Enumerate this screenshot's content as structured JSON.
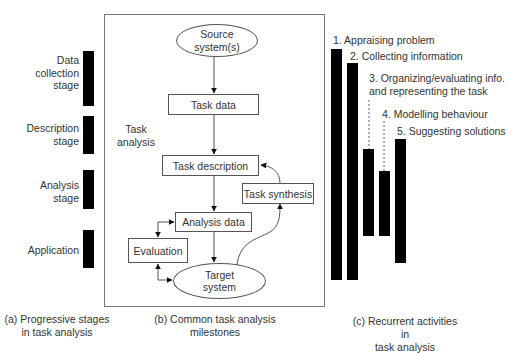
{
  "panel_a": {
    "stages": [
      {
        "label": "Data\ncollection\nstage",
        "bar": {
          "x": 83,
          "y": 51,
          "w": 11,
          "h": 55
        }
      },
      {
        "label": "Description\nstage",
        "bar": {
          "x": 83,
          "y": 116,
          "w": 11,
          "h": 38
        }
      },
      {
        "label": "Analysis\nstage",
        "bar": {
          "x": 83,
          "y": 170,
          "w": 11,
          "h": 39
        }
      },
      {
        "label": "Application",
        "bar": {
          "x": 83,
          "y": 230,
          "w": 11,
          "h": 38
        }
      }
    ],
    "caption": "(a) Progressive stages\nin task analysis"
  },
  "panel_b": {
    "frame_label": "Task\nanalysis",
    "nodes": {
      "source": "Source\nsystem(s)",
      "task_data": "Task data",
      "task_description": "Task description",
      "task_synthesis": "Task synthesis",
      "analysis_data": "Analysis data",
      "evaluation": "Evaluation",
      "target": "Target\nsystem"
    },
    "caption": "(b) Common task analysis\nmilestones"
  },
  "panel_c": {
    "activities": [
      {
        "label": "1. Appraising problem",
        "bar": {
          "x": 331,
          "y": 49,
          "w": 11,
          "h": 231
        }
      },
      {
        "label": "2. Collecting information",
        "bar": {
          "x": 347,
          "y": 63,
          "w": 11,
          "h": 217
        }
      },
      {
        "label": "3. Organizing/evaluating info.\nand representing the task",
        "bar": {
          "x": 363,
          "y": 149,
          "w": 11,
          "h": 87
        }
      },
      {
        "label": "4. Modelling behaviour",
        "bar": {
          "x": 379,
          "y": 171,
          "w": 11,
          "h": 65
        }
      },
      {
        "label": "5. Suggesting solutions",
        "bar": {
          "x": 395,
          "y": 139,
          "w": 11,
          "h": 124
        }
      }
    ],
    "caption": "(c) Recurrent activities in\ntask analysis"
  }
}
